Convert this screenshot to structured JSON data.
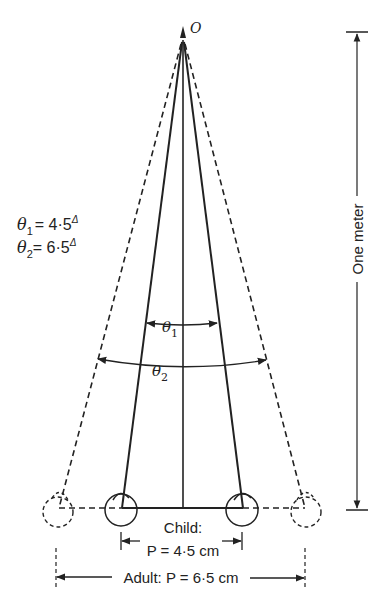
{
  "diagram": {
    "apex_label": "O",
    "equations": {
      "theta1": {
        "symbol": "θ",
        "sub": "1",
        "value": "= 4·5",
        "unit": "Δ"
      },
      "theta2": {
        "symbol": "θ",
        "sub": "2",
        "value": "= 6·5",
        "unit": "Δ"
      }
    },
    "arc_labels": {
      "theta1": {
        "symbol": "θ",
        "sub": "1"
      },
      "theta2": {
        "symbol": "θ",
        "sub": "2"
      }
    },
    "distance_label": "One meter",
    "child": {
      "title": "Child:",
      "measure": "P = 4·5 cm"
    },
    "adult": {
      "label": "Adult: P = 6·5 cm"
    },
    "colors": {
      "ink": "#222222",
      "background": "#ffffff"
    }
  }
}
